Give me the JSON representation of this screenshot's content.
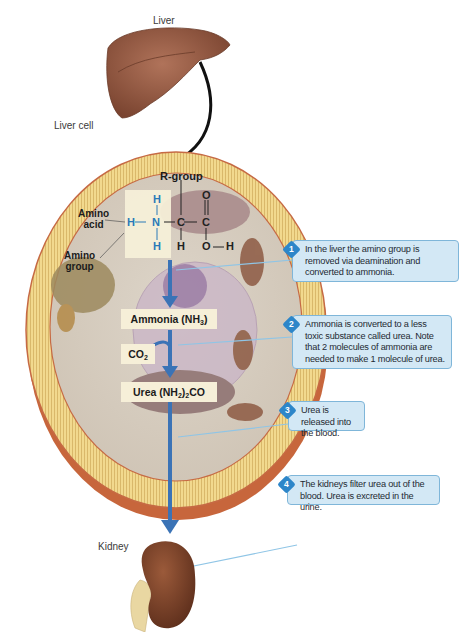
{
  "labels": {
    "liver": "Liver",
    "liver_cell": "Liver cell",
    "kidney": "Kidney",
    "amino_acid": "Amino acid",
    "amino_acid_line1": "Amino",
    "amino_acid_line2": "acid",
    "amino_group_line1": "Amino",
    "amino_group_line2": "group",
    "r_group": "R-group"
  },
  "molecule": {
    "atoms": {
      "h_top": "H",
      "h_left": "H",
      "n": "N",
      "h_bottom": "H",
      "c_alpha": "C",
      "h_alpha": "H",
      "c_carboxyl": "C",
      "o_double": "O",
      "o_single": "O",
      "h_hydroxyl": "H"
    }
  },
  "boxes": {
    "ammonia_text": "Ammonia (NH",
    "ammonia_sub": "3",
    "ammonia_close": ")",
    "co2_text": "CO",
    "co2_sub": "2",
    "urea_text": "Urea (NH",
    "urea_sub": "2",
    "urea_close": ")",
    "urea_sub2": "2",
    "urea_end": "CO"
  },
  "callouts": [
    {
      "number": "1",
      "text": "In the liver the amino group is removed via deamination and converted to ammonia."
    },
    {
      "number": "2",
      "text": "Ammonia is converted to a less toxic substance called urea. Note that 2 molecules of ammonia are needed to make 1 molecule of urea."
    },
    {
      "number": "3",
      "text": "Urea is released into the blood."
    },
    {
      "number": "4",
      "text": "The kidneys filter urea out of the blood. Urea is excreted in the urine."
    }
  ],
  "colors": {
    "callout_bg": "#d3e8f5",
    "callout_border": "#7fb6d9",
    "badge": "#2d86c9",
    "arrow_blue": "#3b73b6",
    "organ_brown": "#8a4e33",
    "membrane_yellow": "#f0d58a"
  }
}
